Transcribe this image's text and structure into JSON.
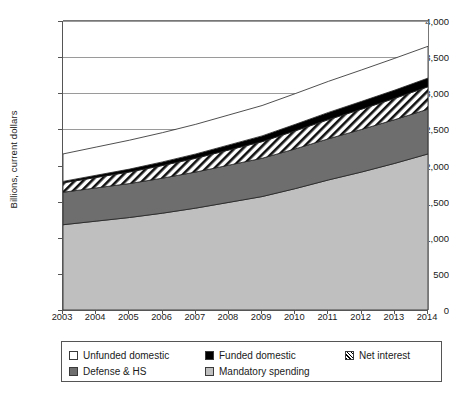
{
  "chart_data": {
    "type": "area",
    "title": "",
    "xlabel": "",
    "ylabel": "Billions, current dollars",
    "stacked": true,
    "grid": true,
    "legend_position": "bottom",
    "xlim": [
      2003,
      2014
    ],
    "ylim": [
      0,
      4000
    ],
    "ytick_labels": [
      "0",
      "500",
      "1,000",
      "1,500",
      "2,000",
      "2,500",
      "3,000",
      "3,500",
      "4,000"
    ],
    "ytick_values": [
      0,
      500,
      1000,
      1500,
      2000,
      2500,
      3000,
      3500,
      4000
    ],
    "categories": [
      "2003",
      "2004",
      "2005",
      "2006",
      "2007",
      "2008",
      "2009",
      "2010",
      "2011",
      "2012",
      "2013",
      "2014"
    ],
    "x": [
      2003,
      2004,
      2005,
      2006,
      2007,
      2008,
      2009,
      2010,
      2011,
      2012,
      2013,
      2014
    ],
    "series": [
      {
        "name": "Mandatory spending",
        "color": "#bfbfbf",
        "pattern": "solid",
        "values": [
          1180,
          1230,
          1280,
          1340,
          1410,
          1490,
          1570,
          1680,
          1800,
          1910,
          2030,
          2160
        ]
      },
      {
        "name": "Defense & HS",
        "color": "#6e6e6e",
        "pattern": "solid",
        "values": [
          450,
          460,
          470,
          485,
          500,
          515,
          530,
          550,
          570,
          590,
          605,
          620
        ]
      },
      {
        "name": "Net interest",
        "color": "#000000",
        "pattern": "diagonal-hatch",
        "values": [
          130,
          145,
          160,
          175,
          190,
          210,
          230,
          250,
          265,
          280,
          295,
          310
        ]
      },
      {
        "name": "Funded domestic",
        "color": "#000000",
        "pattern": "solid",
        "values": [
          20,
          30,
          40,
          50,
          60,
          70,
          80,
          90,
          100,
          108,
          114,
          120
        ]
      },
      {
        "name": "Unfunded domestic",
        "color": "#ffffff",
        "pattern": "solid",
        "values": [
          380,
          390,
          400,
          405,
          410,
          415,
          420,
          425,
          430,
          435,
          440,
          440
        ]
      }
    ],
    "cumulative_totals": {
      "mandatory": [
        1180,
        1230,
        1280,
        1340,
        1410,
        1490,
        1570,
        1680,
        1800,
        1910,
        2030,
        2160
      ],
      "plus_defense_hs": [
        1630,
        1690,
        1750,
        1825,
        1910,
        2005,
        2100,
        2230,
        2370,
        2500,
        2635,
        2780
      ],
      "plus_net_interest": [
        1760,
        1835,
        1910,
        2000,
        2100,
        2215,
        2330,
        2480,
        2635,
        2780,
        2930,
        3090
      ],
      "plus_funded_dom": [
        1780,
        1865,
        1950,
        2050,
        2160,
        2285,
        2410,
        2570,
        2735,
        2888,
        3044,
        3210
      ],
      "grand_total": [
        2160,
        2255,
        2350,
        2455,
        2570,
        2700,
        2830,
        2995,
        3165,
        3323,
        3484,
        3650
      ]
    }
  },
  "legend": {
    "items": [
      {
        "label": "Unfunded domestic",
        "swatch": "sw-white"
      },
      {
        "label": "Funded domestic",
        "swatch": "sw-black"
      },
      {
        "label": "Net interest",
        "swatch": "sw-hatch"
      },
      {
        "label": "Defense & HS",
        "swatch": "sw-dark"
      },
      {
        "label": "Mandatory spending",
        "swatch": "sw-light"
      }
    ]
  }
}
